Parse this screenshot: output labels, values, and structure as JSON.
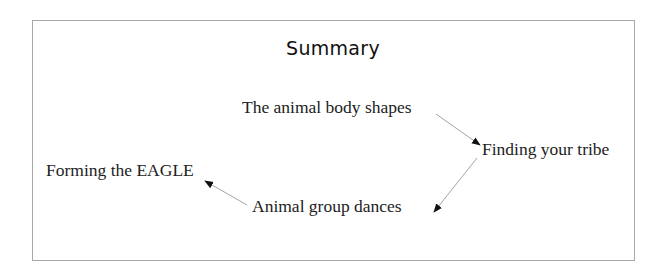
{
  "diagram": {
    "title": "Summary",
    "nodes": [
      {
        "id": "shapes",
        "label": "The animal body shapes"
      },
      {
        "id": "tribe",
        "label": "Finding your tribe"
      },
      {
        "id": "dances",
        "label": "Animal group dances"
      },
      {
        "id": "eagle",
        "label": "Forming the EAGLE"
      }
    ],
    "edges": [
      {
        "from": "shapes",
        "to": "tribe"
      },
      {
        "from": "tribe",
        "to": "dances"
      },
      {
        "from": "dances",
        "to": "eagle"
      }
    ],
    "colors": {
      "border": "#a8a8a8",
      "text": "#222222",
      "arrow_line": "#9a9a9a",
      "arrow_head": "#111111"
    }
  }
}
